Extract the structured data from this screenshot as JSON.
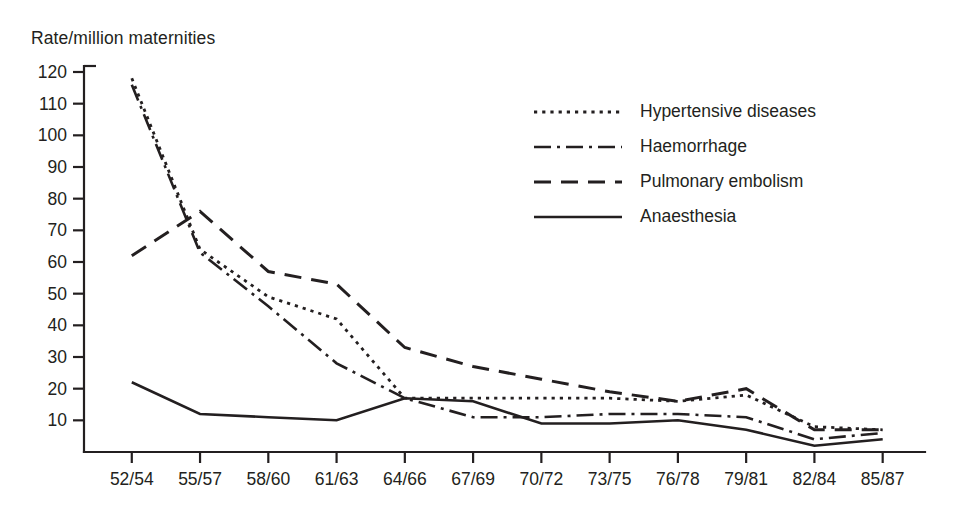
{
  "chart_data": {
    "type": "line",
    "title": "",
    "ylabel": "Rate/million maternities",
    "xlabel": "",
    "categories": [
      "52/54",
      "55/57",
      "58/60",
      "61/63",
      "64/66",
      "67/69",
      "70/72",
      "73/75",
      "76/78",
      "79/81",
      "82/84",
      "85/87"
    ],
    "ylim": [
      0,
      120
    ],
    "ytick_labels": [
      "10",
      "20",
      "30",
      "40",
      "50",
      "60",
      "70",
      "80",
      "90",
      "100",
      "110",
      "120"
    ],
    "ytick_values": [
      10,
      20,
      30,
      40,
      50,
      60,
      70,
      80,
      90,
      100,
      110,
      120
    ],
    "grid": false,
    "legend_position": "inside-upper-right",
    "series": [
      {
        "name": "Hypertensive diseases",
        "style": "dotted",
        "values": [
          118,
          64,
          49,
          42,
          17,
          17,
          17,
          17,
          16,
          18,
          8,
          7
        ]
      },
      {
        "name": "Haemorrhage",
        "style": "dash-dot",
        "values": [
          116,
          63,
          46,
          28,
          17,
          11,
          11,
          12,
          12,
          11,
          4,
          6
        ]
      },
      {
        "name": "Pulmonary embolism",
        "style": "dashed",
        "values": [
          62,
          76,
          57,
          53,
          33,
          27,
          23,
          19,
          16,
          20,
          7,
          7
        ]
      },
      {
        "name": "Anaesthesia",
        "style": "solid",
        "values": [
          22,
          12,
          11,
          10,
          17,
          16,
          9,
          9,
          10,
          7,
          2,
          4
        ]
      }
    ]
  },
  "legend": {
    "items": [
      {
        "label": "Hypertensive diseases"
      },
      {
        "label": "Haemorrhage"
      },
      {
        "label": "Pulmonary embolism"
      },
      {
        "label": "Anaesthesia"
      }
    ]
  }
}
